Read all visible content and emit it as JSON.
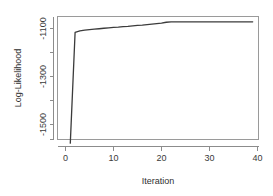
{
  "chart_data": {
    "type": "line",
    "title": "",
    "xlabel": "Iteration",
    "ylabel": "Log-Likelihood",
    "xlim": [
      0,
      40
    ],
    "ylim": [
      -1600,
      -1040
    ],
    "grid": false,
    "legend": "none",
    "x_ticks": [
      {
        "value": 0,
        "label": "0"
      },
      {
        "value": 10,
        "label": "10"
      },
      {
        "value": 20,
        "label": "20"
      },
      {
        "value": 30,
        "label": "30"
      },
      {
        "value": 40,
        "label": "40"
      }
    ],
    "y_ticks": [
      {
        "value": -1100,
        "label": "-1100"
      },
      {
        "value": -1300,
        "label": "-1300"
      },
      {
        "value": -1500,
        "label": "-1500"
      }
    ],
    "y_minor_ticks": [
      -1200,
      -1400,
      -1600
    ],
    "series": [
      {
        "name": "log-likelihood",
        "color": "#3b3b3b",
        "x": [
          1,
          2,
          3,
          4,
          5,
          6,
          7,
          8,
          9,
          10,
          11,
          12,
          13,
          14,
          15,
          16,
          17,
          18,
          19,
          20,
          21,
          22,
          23,
          24,
          25,
          26,
          27,
          28,
          29,
          30,
          31,
          32,
          33,
          34,
          35,
          36,
          37,
          38,
          39
        ],
        "y": [
          -1578,
          -1116,
          -1110,
          -1107,
          -1105,
          -1103,
          -1101,
          -1099,
          -1097,
          -1095,
          -1094,
          -1092,
          -1091,
          -1089,
          -1087,
          -1086,
          -1084,
          -1082,
          -1080,
          -1078,
          -1074,
          -1072,
          -1072,
          -1072,
          -1072,
          -1072,
          -1072,
          -1072,
          -1072,
          -1072,
          -1072,
          -1072,
          -1072,
          -1072,
          -1072,
          -1072,
          -1072,
          -1072,
          -1072
        ]
      }
    ]
  },
  "axes": {
    "x_title": "Iteration",
    "y_title": "Log-Likelihood"
  }
}
